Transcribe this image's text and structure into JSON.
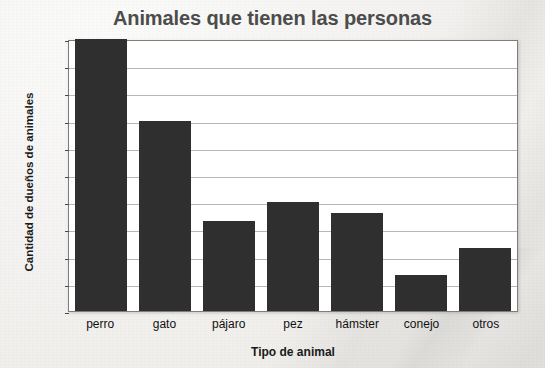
{
  "chart_data": {
    "type": "bar",
    "title": "Animales que tienen las personas",
    "xlabel": "Tipo de animal",
    "ylabel": "Cantidad de dueños de animales",
    "categories": [
      "perro",
      "gato",
      "pájaro",
      "pez",
      "hámster",
      "conejo",
      "otros"
    ],
    "values": [
      50,
      35,
      16.5,
      20,
      18,
      6.7,
      11.5
    ],
    "ylim": [
      0,
      50
    ],
    "yticks": [
      0,
      5,
      10,
      15,
      20,
      25,
      30,
      35,
      40,
      45,
      50
    ],
    "ytick_labels": [
      "0",
      "5",
      "10",
      "15",
      "20",
      "25",
      "30",
      "35",
      "40",
      "45",
      "50"
    ],
    "grid": true,
    "legend": false,
    "bar_color": "#2f2f2f",
    "gridline_color": "#b7b7b7",
    "plot_background": "#ffffff",
    "title_color": "#4c4c4c"
  }
}
